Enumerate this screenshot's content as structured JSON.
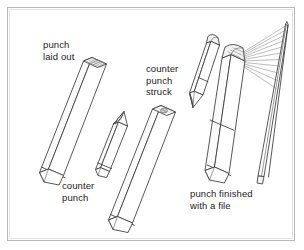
{
  "figure": {
    "kind": "technical-line-drawing",
    "background_color": "#ffffff",
    "line_color": "#3a3a3a",
    "frame_color": "#b9b9b9",
    "text_color": "#232323",
    "labels": [
      {
        "id": "punch-laid-out",
        "lines": "punch\nlaid out"
      },
      {
        "id": "counter-punch",
        "lines": "counter\npunch"
      },
      {
        "id": "counter-punch-struck",
        "lines": "counter\npunch\nstruck"
      },
      {
        "id": "punch-finished",
        "lines": "punch finished\nwith a file"
      }
    ],
    "objects": [
      {
        "id": "punch-blank",
        "description": "long square steel bar with layout marks scribed on its top face"
      },
      {
        "id": "counter-punch-small",
        "description": "short square bar tapered to a point"
      },
      {
        "id": "punch-struck",
        "description": "long square bar with counter punch impression struck into top face"
      },
      {
        "id": "counter-punch-angled",
        "description": "counter punch shown tilted, rounded head and pointed tip"
      },
      {
        "id": "punch-finished-object",
        "description": "finished punch shown beside a tapered file blade"
      }
    ]
  }
}
